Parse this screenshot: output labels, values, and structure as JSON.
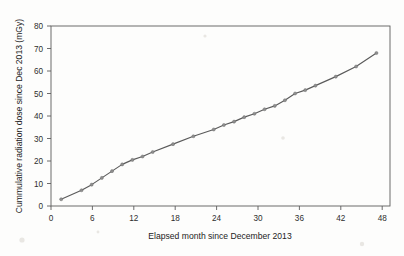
{
  "chart_data": {
    "type": "line",
    "title": "",
    "xlabel": "Elapsed month since December 2013",
    "ylabel": "Cummulative radiation dose since Dec 2013 (mGy)",
    "xlim": [
      0,
      50
    ],
    "ylim": [
      0,
      80
    ],
    "xticks": [
      0,
      6,
      12,
      18,
      24,
      30,
      36,
      42,
      48
    ],
    "xtick_labels": [
      "0",
      "6",
      "12",
      "18",
      "24",
      "30",
      "36",
      "42",
      "48"
    ],
    "yticks": [
      0,
      10,
      20,
      30,
      40,
      50,
      60,
      70,
      80
    ],
    "ytick_labels": [
      "0",
      "10",
      "20",
      "30",
      "40",
      "50",
      "60",
      "70",
      "80"
    ],
    "grid": false,
    "legend": false,
    "legend_position": "none",
    "marker": "circle",
    "line_color": "#5a5a5a",
    "marker_color": "#8e8e8e",
    "frame": true,
    "x": [
      1.5,
      4.5,
      6,
      7.5,
      9,
      10.5,
      12,
      13.5,
      15,
      18,
      21,
      24,
      25.5,
      27,
      28.5,
      30,
      31.5,
      33,
      34.5,
      36,
      37.5,
      39,
      42,
      45,
      48
    ],
    "values": [
      3,
      7,
      9.5,
      12.5,
      15.5,
      18.5,
      20.5,
      22,
      24,
      27.5,
      31,
      34,
      36,
      37.5,
      39.5,
      41,
      43,
      44.5,
      47,
      50,
      51.5,
      53.5,
      57.5,
      62,
      68
    ],
    "series": [
      {
        "name": "Cummulative radiation dose",
        "x": [
          1.5,
          4.5,
          6,
          7.5,
          9,
          10.5,
          12,
          13.5,
          15,
          18,
          21,
          24,
          25.5,
          27,
          28.5,
          30,
          31.5,
          33,
          34.5,
          36,
          37.5,
          39,
          42,
          45,
          48
        ],
        "values": [
          3,
          7,
          9.5,
          12.5,
          15.5,
          18.5,
          20.5,
          22,
          24,
          27.5,
          31,
          34,
          36,
          37.5,
          39.5,
          41,
          43,
          44.5,
          47,
          50,
          51.5,
          53.5,
          57.5,
          62,
          68
        ]
      }
    ]
  }
}
